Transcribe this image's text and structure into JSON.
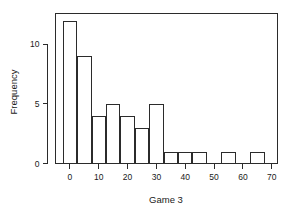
{
  "chart_data": {
    "type": "bar",
    "chart_subtype": "histogram",
    "title": "",
    "xlabel": "Game 3",
    "ylabel": "Frequency",
    "xlim": [
      -5,
      72
    ],
    "ylim": [
      0,
      12.6
    ],
    "grid": false,
    "legend": null,
    "bin_width": 5,
    "bin_edges": [
      -2.5,
      2.5,
      7.5,
      12.5,
      17.5,
      22.5,
      27.5,
      32.5,
      37.5,
      42.5,
      47.5,
      52.5,
      57.5,
      62.5,
      67.5
    ],
    "bin_labels": [
      "-2.5 to 2.5",
      "2.5 to 7.5",
      "7.5 to 12.5",
      "12.5 to 17.5",
      "17.5 to 22.5",
      "22.5 to 27.5",
      "27.5 to 32.5",
      "32.5 to 37.5",
      "37.5 to 42.5",
      "42.5 to 47.5",
      "47.5 to 52.5",
      "52.5 to 57.5",
      "57.5 to 62.5",
      "62.5 to 67.5"
    ],
    "values": [
      12,
      9,
      4,
      5,
      4,
      3,
      5,
      1,
      1,
      1,
      0,
      1,
      0,
      1
    ],
    "categories": [
      "0",
      "5",
      "10",
      "15",
      "20",
      "25",
      "30",
      "35",
      "40",
      "45",
      "50",
      "55",
      "60",
      "65"
    ],
    "xticks": [
      0,
      10,
      20,
      30,
      40,
      50,
      60,
      70
    ],
    "xtick_labels": [
      "0",
      "10",
      "20",
      "30",
      "40",
      "50",
      "60",
      "70"
    ],
    "yticks": [
      0,
      5,
      10
    ],
    "ytick_labels": [
      "0",
      "5",
      "10"
    ],
    "total_count": 47,
    "bar_fill_color": "#ffffff",
    "bar_edge_color": "#2b2b2b",
    "background_color": "#ffffff"
  }
}
